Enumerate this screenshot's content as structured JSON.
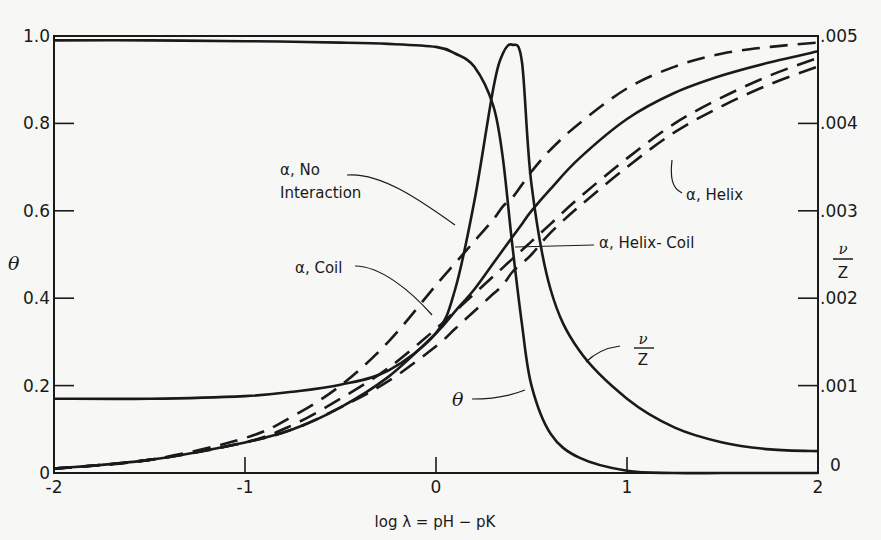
{
  "chart_data": {
    "type": "line",
    "title": "",
    "xlabel": "log λ = pH − pK",
    "ylabel": "θ",
    "ylabel_right_num": "ν",
    "ylabel_right_den": "Z",
    "xlim": [
      -2,
      2
    ],
    "ylim": [
      0,
      1.0
    ],
    "ylim_right": [
      0,
      0.005
    ],
    "grid": false,
    "legend": "none (inline annotations)",
    "x_ticks": [
      -2,
      -1,
      0,
      1,
      2
    ],
    "x_tick_labels": [
      "-2",
      "-1",
      "0",
      "1",
      "2"
    ],
    "y_ticks": [
      0,
      0.2,
      0.4,
      0.6,
      0.8,
      1.0
    ],
    "y_tick_labels": [
      "0",
      "0.2",
      "0.4",
      "0.6",
      "0.8",
      "1.0"
    ],
    "y_right_ticks": [
      0,
      0.001,
      0.002,
      0.003,
      0.004,
      0.005
    ],
    "y_right_tick_labels": [
      "0",
      ".001",
      ".002",
      ".003",
      ".004",
      ".005"
    ],
    "x": [
      -2,
      -1.5,
      -1,
      -0.75,
      -0.5,
      -0.25,
      0,
      0.1,
      0.2,
      0.3,
      0.35,
      0.4,
      0.45,
      0.5,
      0.6,
      0.75,
      1,
      1.25,
      1.5,
      1.75,
      2
    ],
    "series": [
      {
        "name": "θ",
        "axis": "left",
        "style": "solid",
        "values": [
          0.99,
          0.99,
          0.988,
          0.987,
          0.985,
          0.982,
          0.975,
          0.96,
          0.93,
          0.84,
          0.72,
          0.52,
          0.34,
          0.2,
          0.09,
          0.035,
          0.005,
          0.0,
          0.0,
          0.0,
          0.0
        ]
      },
      {
        "name": "ν/Z",
        "axis": "right",
        "style": "solid",
        "values": [
          0.00085,
          0.00085,
          0.00088,
          0.00093,
          0.00101,
          0.00117,
          0.0016,
          0.0021,
          0.0031,
          0.0044,
          0.0048,
          0.0049,
          0.0047,
          0.0033,
          0.0021,
          0.0014,
          0.00085,
          0.00052,
          0.00035,
          0.00027,
          0.00025
        ]
      },
      {
        "name": "α, No Interaction",
        "axis": "left",
        "style": "dashed",
        "values": [
          0.01,
          0.03,
          0.08,
          0.13,
          0.2,
          0.3,
          0.43,
          0.48,
          0.53,
          0.58,
          0.61,
          0.63,
          0.66,
          0.69,
          0.74,
          0.8,
          0.88,
          0.93,
          0.96,
          0.975,
          0.985
        ]
      },
      {
        "name": "α, Coil",
        "axis": "left",
        "style": "dashed",
        "values": [
          0.01,
          0.03,
          0.07,
          0.11,
          0.17,
          0.24,
          0.33,
          0.37,
          0.41,
          0.45,
          0.47,
          0.49,
          0.51,
          0.53,
          0.57,
          0.63,
          0.72,
          0.8,
          0.86,
          0.91,
          0.95
        ]
      },
      {
        "name": "α, Helix",
        "axis": "left",
        "style": "dashed",
        "values": [
          0.01,
          0.03,
          0.07,
          0.1,
          0.15,
          0.21,
          0.29,
          0.33,
          0.37,
          0.41,
          0.43,
          0.46,
          0.48,
          0.5,
          0.55,
          0.61,
          0.7,
          0.78,
          0.84,
          0.89,
          0.93
        ]
      },
      {
        "name": "α, Helix-Coil",
        "axis": "left",
        "style": "solid",
        "values": [
          0.01,
          0.03,
          0.07,
          0.1,
          0.15,
          0.22,
          0.32,
          0.37,
          0.42,
          0.48,
          0.51,
          0.54,
          0.57,
          0.6,
          0.65,
          0.72,
          0.81,
          0.87,
          0.91,
          0.94,
          0.965
        ]
      }
    ],
    "annotations": [
      {
        "text_line1": "α, No",
        "text_line2": "Interaction",
        "points_to": "α, No Interaction"
      },
      {
        "text": "α, Coil",
        "points_to": "α, Coil"
      },
      {
        "text": "α, Helix",
        "points_to": "α, Helix"
      },
      {
        "text": "α, Helix- Coil",
        "points_to": "α, Helix-Coil"
      },
      {
        "text": "θ",
        "points_to": "θ"
      },
      {
        "text_num": "ν",
        "text_den": "Z",
        "points_to": "ν/Z"
      }
    ]
  }
}
